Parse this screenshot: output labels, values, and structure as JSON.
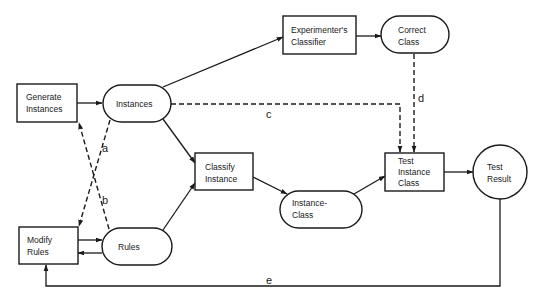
{
  "diagram": {
    "nodes": {
      "generate_instances": {
        "shape": "rectangle",
        "lines": [
          "Generate",
          "Instances"
        ]
      },
      "instances": {
        "shape": "pill",
        "lines": [
          "Instances"
        ]
      },
      "experimenters_classifier": {
        "shape": "rectangle",
        "lines": [
          "Experimenter's",
          "Classifier"
        ]
      },
      "correct_class": {
        "shape": "pill",
        "lines": [
          "Correct",
          "Class"
        ]
      },
      "classify_instance": {
        "shape": "rectangle",
        "lines": [
          "Classify",
          "Instance"
        ]
      },
      "instance_class": {
        "shape": "pill",
        "lines": [
          "Instance-",
          "Class"
        ]
      },
      "test_instance_class": {
        "shape": "rectangle",
        "lines": [
          "Test",
          "Instance",
          "Class"
        ]
      },
      "test_result": {
        "shape": "circle",
        "lines": [
          "Test",
          "Result"
        ]
      },
      "modify_rules": {
        "shape": "rectangle",
        "lines": [
          "Modify",
          "Rules"
        ]
      },
      "rules": {
        "shape": "pill",
        "lines": [
          "Rules"
        ]
      }
    },
    "edges": [
      {
        "from": "Generate Instances",
        "to": "Instances",
        "style": "solid",
        "label": ""
      },
      {
        "from": "Instances",
        "to": "Experimenter's Classifier",
        "style": "solid",
        "label": ""
      },
      {
        "from": "Experimenter's Classifier",
        "to": "Correct Class",
        "style": "solid",
        "label": ""
      },
      {
        "from": "Instances",
        "to": "Classify Instance",
        "style": "solid",
        "label": ""
      },
      {
        "from": "Rules",
        "to": "Classify Instance",
        "style": "solid",
        "label": ""
      },
      {
        "from": "Classify Instance",
        "to": "Instance-Class",
        "style": "solid",
        "label": ""
      },
      {
        "from": "Instance-Class",
        "to": "Test Instance Class",
        "style": "solid",
        "label": ""
      },
      {
        "from": "Test Instance Class",
        "to": "Test Result",
        "style": "solid",
        "label": ""
      },
      {
        "from": "Modify Rules",
        "to": "Rules",
        "style": "solid",
        "label": ""
      },
      {
        "from": "Rules",
        "to": "Modify Rules",
        "style": "solid",
        "label": ""
      },
      {
        "from": "Rules",
        "to": "Generate Instances",
        "style": "dashed",
        "label": "a"
      },
      {
        "from": "Instances",
        "to": "Modify Rules",
        "style": "dashed",
        "label": "b"
      },
      {
        "from": "Instances",
        "to": "Test Instance Class",
        "style": "dashed",
        "label": "c"
      },
      {
        "from": "Correct Class",
        "to": "Test Instance Class",
        "style": "dashed",
        "label": "d"
      },
      {
        "from": "Test Result",
        "to": "Modify Rules",
        "style": "solid",
        "label": "e"
      }
    ],
    "labels": {
      "a": "a",
      "b": "b",
      "c": "c",
      "d": "d",
      "e": "e"
    }
  }
}
